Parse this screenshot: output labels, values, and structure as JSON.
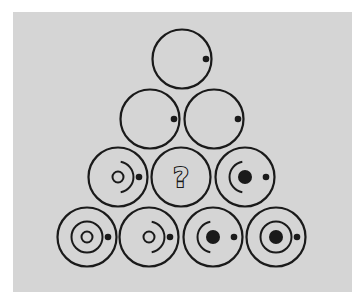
{
  "puzzle": {
    "description": "Triangular pyramid of circles, find the missing tile",
    "colors": {
      "background": "#d5d5d5",
      "ink": "#1a1a1a",
      "page": "#ffffff"
    },
    "question_label": "?",
    "rows": [
      {
        "tiles": [
          {
            "cx": 182,
            "cy": 59,
            "elements": [
              "outer-ring",
              "right-dot-inner"
            ]
          }
        ]
      },
      {
        "tiles": [
          {
            "cx": 150,
            "cy": 119,
            "elements": [
              "outer-ring",
              "right-dot-inner"
            ]
          },
          {
            "cx": 214,
            "cy": 119,
            "elements": [
              "outer-ring",
              "right-dot-inner"
            ]
          }
        ]
      },
      {
        "tiles": [
          {
            "cx": 118,
            "cy": 177,
            "elements": [
              "outer-ring",
              "center-ring",
              "right-arc",
              "right-dot"
            ]
          },
          {
            "cx": 181,
            "cy": 177,
            "elements": [
              "outer-ring",
              "question-mark"
            ],
            "missing": true
          },
          {
            "cx": 245,
            "cy": 177,
            "elements": [
              "outer-ring",
              "center-dot",
              "left-arc",
              "right-dot"
            ]
          }
        ]
      },
      {
        "tiles": [
          {
            "cx": 87,
            "cy": 237,
            "elements": [
              "outer-ring",
              "center-ring",
              "middle-ring",
              "right-dot"
            ]
          },
          {
            "cx": 149,
            "cy": 237,
            "elements": [
              "outer-ring",
              "center-ring",
              "right-arc",
              "right-dot"
            ]
          },
          {
            "cx": 213,
            "cy": 237,
            "elements": [
              "outer-ring",
              "center-dot",
              "left-arc",
              "right-dot"
            ]
          },
          {
            "cx": 276,
            "cy": 237,
            "elements": [
              "outer-ring",
              "center-dot",
              "middle-ring",
              "right-dot"
            ]
          }
        ]
      }
    ]
  }
}
